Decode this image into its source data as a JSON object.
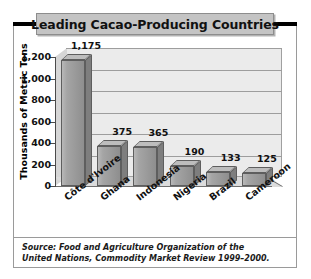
{
  "figure": {
    "title": "Leading Cacao-Producing Countries",
    "source_line_1": "Source: Food and Agriculture Organization of the",
    "source_line_2": "United Nations, Commodity Market Review 1999–2000."
  },
  "chart_data": {
    "type": "bar",
    "title": "Leading Cacao-Producing Countries",
    "xlabel": "",
    "ylabel": "Thousands of Metric Tons",
    "ylim": [
      0,
      1200
    ],
    "ytick_labels": [
      "0",
      "200",
      "400",
      "600",
      "800",
      "1,000",
      "1,200"
    ],
    "ytick_values": [
      0,
      200,
      400,
      600,
      800,
      1000,
      1200
    ],
    "grid": true,
    "legend": "none",
    "categories": [
      "Côte d'Ivoire",
      "Ghana",
      "Indonesia",
      "Nigeria",
      "Brazil",
      "Cameroon"
    ],
    "values": [
      1175,
      375,
      365,
      190,
      133,
      125
    ],
    "value_labels": [
      "1,175",
      "375",
      "365",
      "190",
      "133",
      "125"
    ],
    "colors": {
      "bar_face": "#9b9b9b",
      "bar_top": "#bdbdbd",
      "bar_side": "#7e7e7e",
      "plot_back": "#ebebeb",
      "plot_floor": "#dcdcdc",
      "title_band": "#c4c4c4",
      "text": "#111111"
    }
  }
}
